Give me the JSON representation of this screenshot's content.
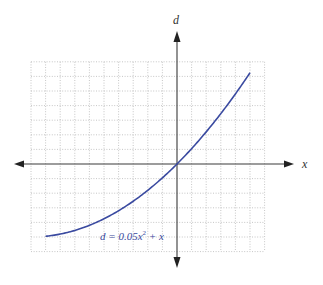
{
  "chart_data": {
    "type": "line",
    "title": "",
    "xlabel": "x",
    "ylabel": "d",
    "equation_label": "d = 0.05x² + x",
    "equation_parts": {
      "lhs": "d = 0.05x",
      "exp": "2",
      "rhs": " + x"
    },
    "grid": true,
    "xlim": [
      -10,
      6
    ],
    "ylim": [
      -6,
      7
    ],
    "grid_step": 1,
    "series": [
      {
        "name": "d = 0.05x^2 + x",
        "color": "#3a4aa0",
        "function": "0.05*x*x + x",
        "x_range": [
          -9,
          5
        ],
        "x": [
          -9,
          -8,
          -7,
          -6,
          -5,
          -4,
          -3,
          -2,
          -1,
          0,
          1,
          2,
          3,
          4,
          5
        ],
        "values": [
          -4.95,
          -4.8,
          -4.55,
          -4.2,
          -3.75,
          -3.2,
          -2.55,
          -1.8,
          -0.95,
          0,
          1.05,
          2.2,
          3.45,
          4.8,
          6.25
        ]
      }
    ]
  },
  "colors": {
    "curve": "#3a4aa0",
    "grid": "#b8b8b8",
    "axis": "#3a3a3a"
  }
}
